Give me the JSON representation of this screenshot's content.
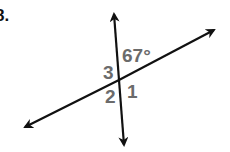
{
  "problem": {
    "number": "8."
  },
  "diagram": {
    "angle_labels": {
      "known_angle": "67°",
      "angle_3": "3",
      "angle_2": "2",
      "angle_1": "1"
    },
    "colors": {
      "lines": "#111111",
      "labels": "#6b6b6b"
    }
  }
}
